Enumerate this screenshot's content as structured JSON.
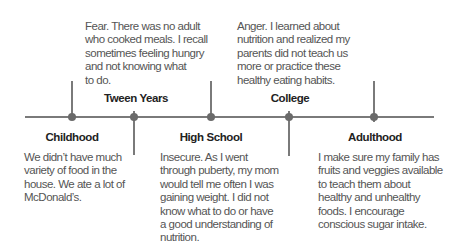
{
  "timeline": {
    "stages": [
      {
        "id": "childhood",
        "label": "Childhood",
        "position": "below",
        "text": "We didn’t have much\nvariety of food in the\nhouse. We ate a lot of\nMcDonald’s."
      },
      {
        "id": "tween",
        "label": "Tween Years",
        "position": "above",
        "text": "Fear. There was no adult\nwho cooked meals. I recall\nsometimes feeling hungry\nand not knowing what\nto do."
      },
      {
        "id": "high-school",
        "label": "High School",
        "position": "below",
        "text": "Insecure. As I went\nthrough puberty, my mom\nwould tell me often I was\ngaining weight. I did not\nknow what to do or have\na good understanding of\nnutrition."
      },
      {
        "id": "college",
        "label": "College",
        "position": "above",
        "text": "Anger. I learned about\nnutrition and realized my\nparents did not teach us\nmore or practice these\nhealthy eating habits."
      },
      {
        "id": "adulthood",
        "label": "Adulthood",
        "position": "below",
        "text": "I make sure my family has\nfruits and veggies available\nto teach them about\nhealthy and unhealthy\nfoods. I encourage\nconscious sugar intake."
      }
    ]
  },
  "colors": {
    "line": "#7a7a7a",
    "dot": "#6a6a6a",
    "label": "#222222",
    "text": "#555555"
  }
}
